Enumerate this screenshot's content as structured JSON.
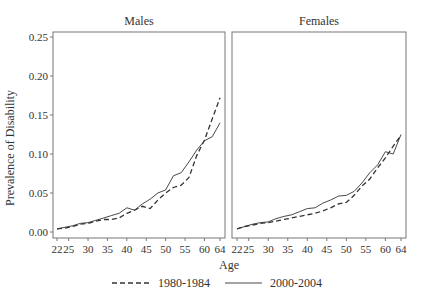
{
  "chart_data": {
    "type": "line",
    "ylabel": "Prevalence of Disability",
    "xlabel": "Age",
    "ylim": [
      0,
      0.25
    ],
    "xlim": [
      22,
      64
    ],
    "yticks": [
      0.0,
      0.05,
      0.1,
      0.15,
      0.2,
      0.25
    ],
    "ytick_labels": [
      "0.00",
      "0.05",
      "0.10",
      "0.15",
      "0.20",
      "0.25"
    ],
    "xticks": [
      22,
      25,
      30,
      35,
      40,
      45,
      50,
      55,
      60,
      64
    ],
    "grid": false,
    "legend_position": "bottom",
    "legend": [
      {
        "label": "1980-1984",
        "style": "dashed"
      },
      {
        "label": "2000-2004",
        "style": "solid"
      }
    ],
    "panels": [
      {
        "title": "Males",
        "x": [
          22,
          24,
          26,
          28,
          30,
          32,
          34,
          36,
          38,
          40,
          42,
          44,
          46,
          48,
          50,
          52,
          54,
          56,
          58,
          60,
          62,
          64
        ],
        "series": [
          {
            "name": "1980-1984",
            "values": [
              0.004,
              0.005,
              0.007,
              0.01,
              0.011,
              0.014,
              0.016,
              0.016,
              0.018,
              0.024,
              0.028,
              0.033,
              0.03,
              0.041,
              0.05,
              0.057,
              0.06,
              0.07,
              0.098,
              0.118,
              0.145,
              0.172
            ]
          },
          {
            "name": "2000-2004",
            "values": [
              0.004,
              0.006,
              0.008,
              0.011,
              0.012,
              0.015,
              0.018,
              0.021,
              0.024,
              0.031,
              0.028,
              0.036,
              0.042,
              0.05,
              0.054,
              0.072,
              0.076,
              0.09,
              0.105,
              0.117,
              0.122,
              0.14
            ]
          }
        ]
      },
      {
        "title": "Females",
        "x": [
          22,
          24,
          26,
          28,
          30,
          32,
          34,
          36,
          38,
          40,
          42,
          44,
          46,
          48,
          50,
          52,
          54,
          56,
          58,
          60,
          62,
          64
        ],
        "series": [
          {
            "name": "1980-1984",
            "values": [
              0.004,
              0.007,
              0.009,
              0.011,
              0.012,
              0.014,
              0.016,
              0.018,
              0.02,
              0.022,
              0.024,
              0.027,
              0.031,
              0.036,
              0.038,
              0.047,
              0.059,
              0.068,
              0.082,
              0.095,
              0.11,
              0.124
            ]
          },
          {
            "name": "2000-2004",
            "values": [
              0.004,
              0.007,
              0.01,
              0.012,
              0.013,
              0.017,
              0.02,
              0.022,
              0.026,
              0.03,
              0.031,
              0.037,
              0.041,
              0.046,
              0.047,
              0.052,
              0.063,
              0.076,
              0.086,
              0.103,
              0.1,
              0.125
            ]
          }
        ]
      }
    ]
  }
}
